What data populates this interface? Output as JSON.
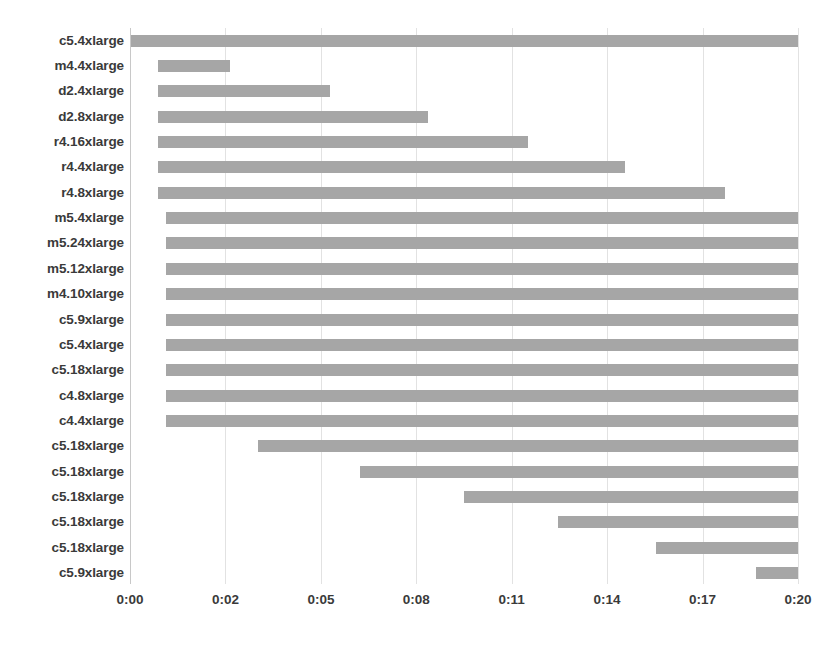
{
  "chart_data": {
    "type": "bar",
    "subtype": "stacked-horizontal-gantt",
    "title": "",
    "subtitle": "",
    "xlabel": "",
    "ylabel": "",
    "grid": true,
    "legend": false,
    "orientation": "horizontal",
    "xlim": [
      "0:00",
      "0:20"
    ],
    "xlim_minutes": [
      0,
      20
    ],
    "xtick_labels": [
      "0:00",
      "0:02",
      "0:05",
      "0:08",
      "0:11",
      "0:14",
      "0:17",
      "0:20"
    ],
    "xtick_minutes": [
      0,
      2.86,
      5.71,
      8.57,
      11.43,
      14.29,
      17.14,
      20
    ],
    "xtick_pixels": [
      130,
      225.4,
      320.9,
      416.3,
      511.7,
      607.1,
      702.6,
      798
    ],
    "categories": [
      "c5.4xlarge",
      "m4.4xlarge",
      "d2.4xlarge",
      "d2.8xlarge",
      "r4.16xlarge",
      "r4.4xlarge",
      "r4.8xlarge",
      "m5.4xlarge",
      "m5.24xlarge",
      "m5.12xlarge",
      "m4.10xlarge",
      "c5.9xlarge",
      "c5.4xlarge",
      "c5.18xlarge",
      "c4.8xlarge",
      "c4.4xlarge",
      "c5.18xlarge",
      "c5.18xlarge",
      "c5.18xlarge",
      "c5.18xlarge",
      "c5.18xlarge",
      "c5.9xlarge"
    ],
    "bars": [
      {
        "label": "c5.4xlarge",
        "start": "0:00",
        "end": "0:20",
        "start_min": 0.0,
        "end_min": 20.0,
        "duration_min": 20.0
      },
      {
        "label": "m4.4xlarge",
        "start": "0:01",
        "end": "0:02",
        "start_min": 0.84,
        "end_min": 2.99,
        "duration_min": 2.15
      },
      {
        "label": "d2.4xlarge",
        "start": "0:01",
        "end": "0:05",
        "start_min": 0.84,
        "end_min": 5.97,
        "duration_min": 5.13
      },
      {
        "label": "d2.8xlarge",
        "start": "0:01",
        "end": "0:08",
        "start_min": 0.84,
        "end_min": 8.25,
        "duration_min": 7.41
      },
      {
        "label": "r4.16xlarge",
        "start": "0:01",
        "end": "0:11",
        "start_min": 0.84,
        "end_min": 11.4,
        "duration_min": 10.56
      },
      {
        "label": "r4.4xlarge",
        "start": "0:01",
        "end": "0:14",
        "start_min": 0.84,
        "end_min": 14.5,
        "duration_min": 13.66
      },
      {
        "label": "r4.8xlarge",
        "start": "0:01",
        "end": "0:17",
        "start_min": 0.84,
        "end_min": 17.5,
        "duration_min": 16.66
      },
      {
        "label": "m5.4xlarge",
        "start": "0:01",
        "end": "0:20",
        "start_min": 1.08,
        "end_min": 20.0,
        "duration_min": 18.92
      },
      {
        "label": "m5.24xlarge",
        "start": "0:01",
        "end": "0:20",
        "start_min": 1.08,
        "end_min": 20.0,
        "duration_min": 18.92
      },
      {
        "label": "m5.12xlarge",
        "start": "0:01",
        "end": "0:20",
        "start_min": 1.08,
        "end_min": 20.0,
        "duration_min": 18.92
      },
      {
        "label": "m4.10xlarge",
        "start": "0:01",
        "end": "0:20",
        "start_min": 1.08,
        "end_min": 20.0,
        "duration_min": 18.92
      },
      {
        "label": "c5.9xlarge",
        "start": "0:01",
        "end": "0:20",
        "start_min": 1.08,
        "end_min": 20.0,
        "duration_min": 18.92
      },
      {
        "label": "c5.4xlarge",
        "start": "0:01",
        "end": "0:20",
        "start_min": 1.08,
        "end_min": 20.0,
        "duration_min": 18.92
      },
      {
        "label": "c5.18xlarge",
        "start": "0:01",
        "end": "0:20",
        "start_min": 1.08,
        "end_min": 20.0,
        "duration_min": 18.92
      },
      {
        "label": "c4.8xlarge",
        "start": "0:01",
        "end": "0:20",
        "start_min": 1.08,
        "end_min": 20.0,
        "duration_min": 18.92
      },
      {
        "label": "c4.4xlarge",
        "start": "0:01",
        "end": "0:20",
        "start_min": 1.08,
        "end_min": 20.0,
        "duration_min": 18.92
      },
      {
        "label": "c5.18xlarge",
        "start": "0:03",
        "end": "0:20",
        "start_min": 3.83,
        "end_min": 20.0,
        "duration_min": 16.17
      },
      {
        "label": "c5.18xlarge",
        "start": "0:06",
        "end": "0:20",
        "start_min": 6.88,
        "end_min": 20.0,
        "duration_min": 13.12
      },
      {
        "label": "c5.18xlarge",
        "start": "0:09",
        "end": "0:20",
        "start_min": 10.0,
        "end_min": 20.0,
        "duration_min": 10.0
      },
      {
        "label": "c5.18xlarge",
        "start": "0:12",
        "end": "0:20",
        "start_min": 12.8,
        "end_min": 20.0,
        "duration_min": 7.2
      },
      {
        "label": "c5.18xlarge",
        "start": "0:16",
        "end": "0:20",
        "start_min": 15.7,
        "end_min": 20.0,
        "duration_min": 4.3
      },
      {
        "label": "c5.9xlarge",
        "start": "0:19",
        "end": "0:20",
        "start_min": 18.7,
        "end_min": 20.0,
        "duration_min": 1.3
      }
    ],
    "bar_pixels": [
      {
        "x": 130,
        "w": 668
      },
      {
        "x": 158,
        "w": 72
      },
      {
        "x": 158,
        "w": 172
      },
      {
        "x": 158,
        "w": 270
      },
      {
        "x": 158,
        "w": 370
      },
      {
        "x": 158,
        "w": 467
      },
      {
        "x": 158,
        "w": 567
      },
      {
        "x": 166,
        "w": 632
      },
      {
        "x": 166,
        "w": 632
      },
      {
        "x": 166,
        "w": 632
      },
      {
        "x": 166,
        "w": 632
      },
      {
        "x": 166,
        "w": 632
      },
      {
        "x": 166,
        "w": 632
      },
      {
        "x": 166,
        "w": 632
      },
      {
        "x": 166,
        "w": 632
      },
      {
        "x": 166,
        "w": 632
      },
      {
        "x": 258,
        "w": 540
      },
      {
        "x": 360,
        "w": 438
      },
      {
        "x": 464,
        "w": 334
      },
      {
        "x": 558,
        "w": 240
      },
      {
        "x": 656,
        "w": 142
      },
      {
        "x": 756,
        "w": 42
      }
    ],
    "colors": {
      "bar": "#a6a6a6",
      "gridline": "#e2e2e2",
      "axis": "#c8c8c8",
      "text": "#3a3a3a",
      "background": "#ffffff"
    }
  }
}
